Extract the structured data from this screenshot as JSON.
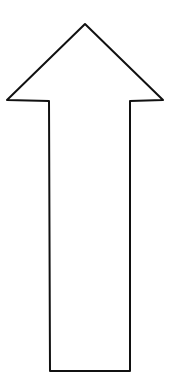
{
  "figure": {
    "shape": "up-arrow-outline",
    "stroke_color": "#111111",
    "fill_color": "#ffffff",
    "stroke_width": 2
  }
}
